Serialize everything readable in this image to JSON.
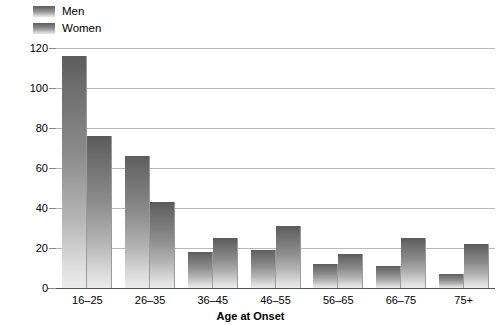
{
  "chart_data": {
    "type": "bar",
    "title": "",
    "xlabel": "Age at Onset",
    "ylabel": "Number of Individuals",
    "categories": [
      "16–25",
      "26–35",
      "36–45",
      "46–55",
      "56–65",
      "66–75",
      "75+"
    ],
    "series": [
      {
        "name": "Men",
        "values": [
          116,
          66,
          18,
          19,
          12,
          11,
          7
        ],
        "color": "#6c6c6c"
      },
      {
        "name": "Women",
        "values": [
          76,
          43,
          25,
          31,
          17,
          25,
          22
        ],
        "color": "#6a6a6a"
      }
    ],
    "ylim": [
      0,
      120
    ],
    "yticks": [
      0,
      20,
      40,
      60,
      80,
      100,
      120
    ],
    "ytick_labels": [
      "0",
      "20",
      "40",
      "60",
      "80",
      "100",
      "120"
    ],
    "grid": true,
    "legend_position": "top-left"
  }
}
